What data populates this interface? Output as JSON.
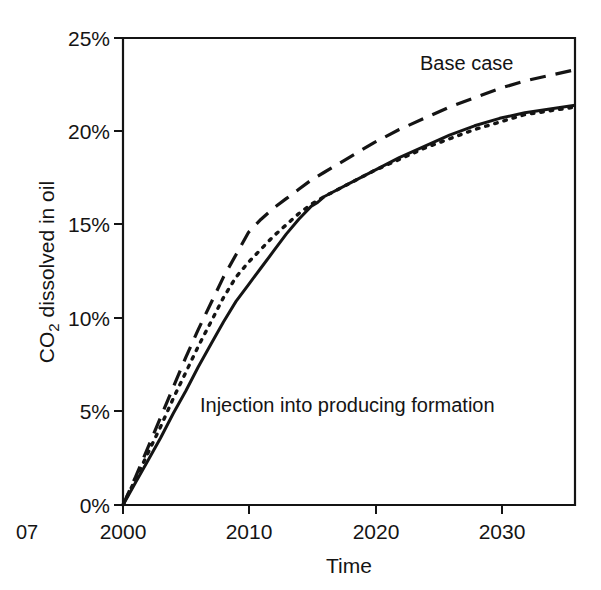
{
  "figure": {
    "corner_label": "07",
    "background_color": "#ffffff",
    "ink_color": "#141414"
  },
  "chart_data": {
    "type": "line",
    "title": "",
    "xlabel": "Time",
    "ylabel": "CO2 dissolved in oil",
    "ylabel_parts": {
      "prefix": "CO",
      "subscript": "2",
      "suffix": " dissolved in oil"
    },
    "xlim": [
      2000,
      2036
    ],
    "ylim": [
      0,
      25
    ],
    "xticks": [
      2000,
      2010,
      2020,
      2030
    ],
    "xtick_labels": [
      "2000",
      "2010",
      "2020",
      "2030"
    ],
    "yticks": [
      0,
      5,
      10,
      15,
      20,
      25
    ],
    "ytick_labels": [
      "0%",
      "5%",
      "10%",
      "15%",
      "20%",
      "25%"
    ],
    "grid": false,
    "legend_position": "inline-annotations",
    "y_unit": "%",
    "annotations": [
      {
        "text": "Base case",
        "x": 2025.5,
        "y": 23.3,
        "series": "base-case"
      },
      {
        "text": "Injection into producing formation",
        "x": 2011.5,
        "y": 5.3,
        "series": "injection-into-producing-formation"
      }
    ],
    "series": [
      {
        "name": "Base case",
        "style": "dashed",
        "x": [
          2000,
          2001,
          2002,
          2003,
          2004,
          2005,
          2006,
          2007,
          2008,
          2009,
          2010,
          2011,
          2012,
          2013,
          2014,
          2015,
          2016,
          2018,
          2020,
          2022,
          2024,
          2026,
          2028,
          2030,
          2032,
          2034,
          2036
        ],
        "values": [
          0.0,
          1.5,
          3.1,
          4.7,
          6.3,
          7.9,
          9.4,
          10.8,
          12.2,
          13.4,
          14.6,
          15.3,
          15.9,
          16.4,
          16.9,
          17.4,
          17.8,
          18.6,
          19.4,
          20.1,
          20.7,
          21.3,
          21.8,
          22.3,
          22.7,
          23.0,
          23.3
        ]
      },
      {
        "name": "Dotted case",
        "style": "dotted",
        "x": [
          2000,
          2001,
          2002,
          2003,
          2004,
          2005,
          2006,
          2007,
          2008,
          2009,
          2010,
          2011,
          2012,
          2013,
          2014,
          2015,
          2016,
          2018,
          2020,
          2022,
          2024,
          2026,
          2028,
          2030,
          2032,
          2034,
          2036
        ],
        "values": [
          0.0,
          1.4,
          2.8,
          4.2,
          5.7,
          7.1,
          8.5,
          9.8,
          11.1,
          12.2,
          13.0,
          13.7,
          14.4,
          15.0,
          15.6,
          16.1,
          16.5,
          17.2,
          17.9,
          18.5,
          19.1,
          19.6,
          20.1,
          20.5,
          20.9,
          21.1,
          21.3
        ]
      },
      {
        "name": "Injection into producing formation",
        "style": "solid",
        "x": [
          2000,
          2001,
          2002,
          2003,
          2004,
          2005,
          2006,
          2007,
          2008,
          2009,
          2010,
          2011,
          2012,
          2013,
          2014,
          2015,
          2015.5,
          2016,
          2018,
          2020,
          2022,
          2024,
          2026,
          2028,
          2030,
          2032,
          2034,
          2036
        ],
        "values": [
          0.0,
          1.2,
          2.4,
          3.6,
          4.9,
          6.1,
          7.4,
          8.6,
          9.8,
          10.9,
          11.8,
          12.7,
          13.6,
          14.5,
          15.3,
          16.0,
          16.2,
          16.5,
          17.2,
          17.9,
          18.6,
          19.2,
          19.8,
          20.3,
          20.7,
          21.0,
          21.2,
          21.4
        ]
      }
    ]
  }
}
